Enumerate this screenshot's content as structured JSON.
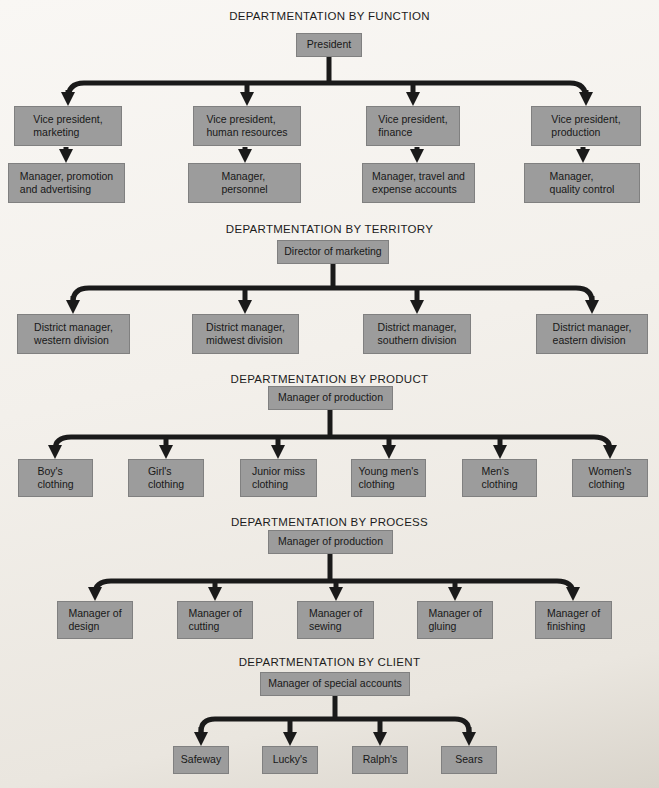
{
  "page": {
    "background": "#f2efea",
    "box_fill": "#9c9c9c",
    "line_color": "#1a1a1a"
  },
  "sections": [
    {
      "title": "DEPARTMENTATION BY FUNCTION",
      "parent": "President",
      "children": [
        {
          "label": "Vice president,\nmarketing",
          "report": "Manager, promotion\nand advertising"
        },
        {
          "label": "Vice president,\nhuman resources",
          "report": "Manager,\npersonnel"
        },
        {
          "label": "Vice president,\nfinance",
          "report": "Manager, travel and\nexpense accounts"
        },
        {
          "label": "Vice president,\nproduction",
          "report": "Manager,\nquality control"
        }
      ]
    },
    {
      "title": "DEPARTMENTATION BY TERRITORY",
      "parent": "Director of marketing",
      "children": [
        {
          "label": "District manager,\nwestern division"
        },
        {
          "label": "District manager,\nmidwest division"
        },
        {
          "label": "District manager,\nsouthern division"
        },
        {
          "label": "District manager,\neastern division"
        }
      ]
    },
    {
      "title": "DEPARTMENTATION BY PRODUCT",
      "parent": "Manager of production",
      "children": [
        {
          "label": "Boy's\nclothing"
        },
        {
          "label": "Girl's\nclothing"
        },
        {
          "label": "Junior miss\nclothing"
        },
        {
          "label": "Young men's\nclothing"
        },
        {
          "label": "Men's\nclothing"
        },
        {
          "label": "Women's\nclothing"
        }
      ]
    },
    {
      "title": "DEPARTMENTATION BY PROCESS",
      "parent": "Manager of production",
      "children": [
        {
          "label": "Manager of\ndesign"
        },
        {
          "label": "Manager of\ncutting"
        },
        {
          "label": "Manager of\nsewing"
        },
        {
          "label": "Manager of\ngluing"
        },
        {
          "label": "Manager of\nfinishing"
        }
      ]
    },
    {
      "title": "DEPARTMENTATION BY CLIENT",
      "parent": "Manager of special accounts",
      "children": [
        {
          "label": "Safeway"
        },
        {
          "label": "Lucky's"
        },
        {
          "label": "Ralph's"
        },
        {
          "label": "Sears"
        }
      ]
    }
  ]
}
